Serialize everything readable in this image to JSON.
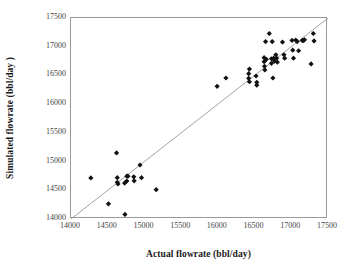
{
  "chart_data": {
    "type": "scatter",
    "title": "",
    "xlabel": "Actual flowrate (bbl/day)",
    "ylabel": "Simulated flowrate (bbl/day )",
    "xlim": [
      14000,
      17500
    ],
    "ylim": [
      14000,
      17500
    ],
    "xticks": [
      14000,
      14500,
      15000,
      15500,
      16000,
      16500,
      17000,
      17500
    ],
    "yticks": [
      14000,
      14500,
      15000,
      15500,
      16000,
      16500,
      17000,
      17500
    ],
    "xtick_labels": [
      "14000",
      "14500",
      "15000",
      "15500",
      "16000",
      "16500",
      "17000",
      "17500"
    ],
    "ytick_labels": [
      "14000",
      "14500",
      "15000",
      "15500",
      "16000",
      "16500",
      "17000",
      "17500"
    ],
    "grid": false,
    "legend": null,
    "marker": "diamond",
    "marker_color": "#111111",
    "frame_color": "#9a9a9a",
    "reference_line": {
      "name": "y = x parity line",
      "from": [
        14000,
        14000
      ],
      "to": [
        17500,
        17500
      ],
      "color": "#8a8a8a"
    },
    "series": [
      {
        "name": "Simulated vs actual flowrate",
        "points": [
          [
            14270,
            14715
          ],
          [
            14510,
            14265
          ],
          [
            14620,
            15150
          ],
          [
            14630,
            14720
          ],
          [
            14630,
            14640
          ],
          [
            14640,
            14610
          ],
          [
            14730,
            14625
          ],
          [
            14735,
            14080
          ],
          [
            14760,
            14745
          ],
          [
            14760,
            14660
          ],
          [
            14775,
            14745
          ],
          [
            14855,
            14735
          ],
          [
            14860,
            14665
          ],
          [
            14940,
            14940
          ],
          [
            14960,
            14720
          ],
          [
            15160,
            14510
          ],
          [
            15990,
            16310
          ],
          [
            16110,
            16455
          ],
          [
            16420,
            16530
          ],
          [
            16420,
            16450
          ],
          [
            16430,
            16610
          ],
          [
            16430,
            16390
          ],
          [
            16520,
            16490
          ],
          [
            16530,
            16380
          ],
          [
            16530,
            16330
          ],
          [
            16630,
            16810
          ],
          [
            16630,
            16740
          ],
          [
            16635,
            16660
          ],
          [
            16640,
            16595
          ],
          [
            16650,
            17090
          ],
          [
            16660,
            16780
          ],
          [
            16700,
            17230
          ],
          [
            16730,
            16790
          ],
          [
            16730,
            16710
          ],
          [
            16740,
            17090
          ],
          [
            16750,
            16455
          ],
          [
            16760,
            16800
          ],
          [
            16770,
            16750
          ],
          [
            16790,
            16860
          ],
          [
            16800,
            16800
          ],
          [
            16810,
            16730
          ],
          [
            16880,
            17080
          ],
          [
            16900,
            16860
          ],
          [
            16910,
            16800
          ],
          [
            17010,
            17110
          ],
          [
            17020,
            16940
          ],
          [
            17030,
            16800
          ],
          [
            17060,
            17115
          ],
          [
            17080,
            17090
          ],
          [
            17100,
            16930
          ],
          [
            17150,
            17110
          ],
          [
            17160,
            17105
          ],
          [
            17180,
            17120
          ],
          [
            17270,
            16700
          ],
          [
            17300,
            17230
          ],
          [
            17310,
            17100
          ]
        ]
      }
    ]
  }
}
